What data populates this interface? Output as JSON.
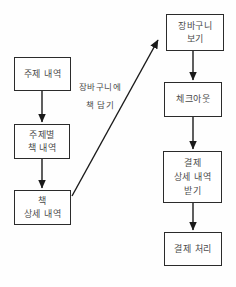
{
  "flowchart": {
    "browse_flow": [
      {
        "id": "subject-list",
        "label": "주제 내역"
      },
      {
        "id": "books-by-subject",
        "label": "주제별\n책 내역"
      },
      {
        "id": "book-detail",
        "label": "책\n상세 내역"
      }
    ],
    "checkout_flow": [
      {
        "id": "view-cart",
        "label": "장바구니\n보기"
      },
      {
        "id": "checkout",
        "label": "체크아웃"
      },
      {
        "id": "get-payment-details",
        "label": "결제\n상세 내역\n받기"
      },
      {
        "id": "process-payment",
        "label": "결제 처리"
      }
    ],
    "transition_label": "장바구니에\n책 담기",
    "colors": {
      "box_border": "#2b2b2b",
      "box_fill": "#ffffff",
      "text": "#4a4a4a",
      "arrow": "#1a1a1a"
    }
  }
}
